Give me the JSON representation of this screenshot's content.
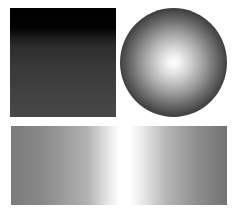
{
  "shapes": {
    "square": {
      "kind": "rectangle",
      "gradient": "vertical",
      "colors": [
        "#000000",
        "#2e2e2e",
        "#474747"
      ]
    },
    "sphere": {
      "kind": "circle",
      "gradient": "radial",
      "colors": [
        "#ffffff",
        "#a3a3a3",
        "#050505"
      ]
    },
    "bar": {
      "kind": "rectangle",
      "gradient": "horizontal",
      "colors": [
        "#7a7a7a",
        "#ffffff",
        "#737373"
      ]
    }
  }
}
